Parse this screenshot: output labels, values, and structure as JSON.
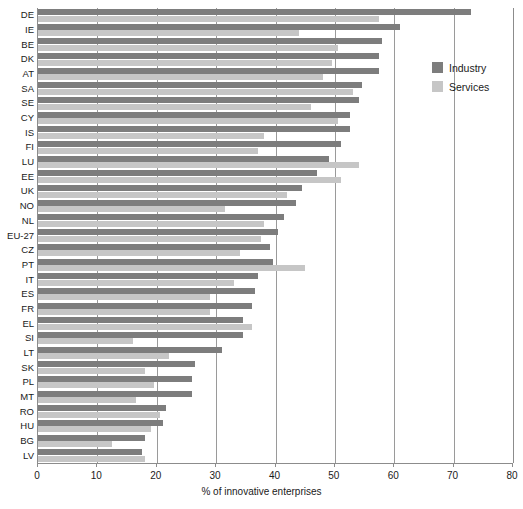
{
  "chart_data": {
    "type": "bar",
    "orientation": "horizontal",
    "title": "",
    "xlabel": "% of innovative enterprises",
    "ylabel": "",
    "xlim": [
      0,
      80
    ],
    "xticks": [
      0,
      10,
      20,
      30,
      40,
      50,
      60,
      70,
      80
    ],
    "xtick_labels": [
      "0",
      "10",
      "20",
      "30",
      "40",
      "50",
      "60",
      "70",
      "80"
    ],
    "grid": true,
    "grid_axis": "x",
    "legend_position": "upper right",
    "categories": [
      "DE",
      "IE",
      "BE",
      "DK",
      "AT",
      "SA",
      "SE",
      "CY",
      "IS",
      "FI",
      "LU",
      "EE",
      "UK",
      "NO",
      "NL",
      "EU-27",
      "CZ",
      "PT",
      "IT",
      "ES",
      "FR",
      "EL",
      "SI",
      "LT",
      "SK",
      "PL",
      "MT",
      "RO",
      "HU",
      "BG",
      "LV"
    ],
    "series": [
      {
        "name": "Industry",
        "color": "#7d7d7d",
        "values": [
          73.0,
          61.0,
          58.0,
          57.5,
          57.5,
          54.5,
          54.0,
          52.5,
          52.5,
          51.0,
          49.0,
          47.0,
          44.5,
          43.5,
          41.5,
          40.5,
          39.0,
          39.5,
          37.0,
          36.5,
          36.0,
          34.5,
          34.5,
          31.0,
          26.5,
          26.0,
          26.0,
          21.5,
          21.0,
          18.0,
          17.5
        ]
      },
      {
        "name": "Services",
        "color": "#c6c6c6",
        "values": [
          57.5,
          44.0,
          50.5,
          49.5,
          48.0,
          53.0,
          46.0,
          50.5,
          38.0,
          37.0,
          54.0,
          51.0,
          42.0,
          31.5,
          38.0,
          37.5,
          34.0,
          45.0,
          33.0,
          29.0,
          29.0,
          36.0,
          16.0,
          22.0,
          18.0,
          19.5,
          16.5,
          20.5,
          19.0,
          12.5,
          18.0
        ]
      }
    ]
  },
  "legend": {
    "items": [
      {
        "label": "Industry",
        "key": "industry"
      },
      {
        "label": "Services",
        "key": "services"
      }
    ]
  },
  "axis": {
    "x_title": "% of innovative enterprises"
  }
}
